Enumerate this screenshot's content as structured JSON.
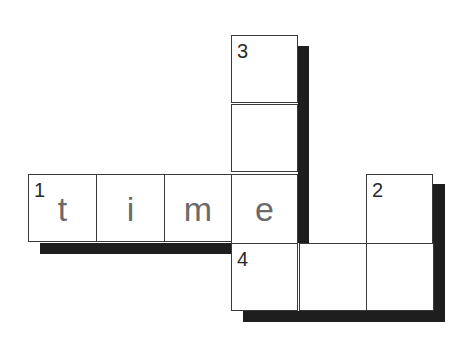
{
  "puzzle": {
    "type": "crossword",
    "cells": [
      {
        "row": 0,
        "col": 3,
        "number": "3",
        "letter": ""
      },
      {
        "row": 1,
        "col": 3,
        "number": "",
        "letter": ""
      },
      {
        "row": 2,
        "col": 0,
        "number": "1",
        "letter": "t"
      },
      {
        "row": 2,
        "col": 1,
        "number": "",
        "letter": "i"
      },
      {
        "row": 2,
        "col": 2,
        "number": "",
        "letter": "m"
      },
      {
        "row": 2,
        "col": 3,
        "number": "",
        "letter": "e"
      },
      {
        "row": 2,
        "col": 5,
        "number": "2",
        "letter": ""
      },
      {
        "row": 3,
        "col": 3,
        "number": "4",
        "letter": ""
      },
      {
        "row": 3,
        "col": 4,
        "number": "",
        "letter": ""
      },
      {
        "row": 3,
        "col": 5,
        "number": "",
        "letter": ""
      }
    ],
    "colors": {
      "border": "#3a3a3a",
      "shadow": "#1e1e1e",
      "letter": "#6a6a6a",
      "number": "#2a2a2a"
    }
  }
}
